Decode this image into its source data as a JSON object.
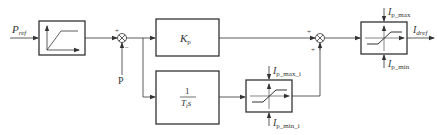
{
  "diagram": {
    "type": "control block diagram",
    "inputs": {
      "p_ref": {
        "main": "P",
        "sub": "ref"
      },
      "p_feedback": "P"
    },
    "blocks": {
      "ramp_limiter": {
        "name": "ramp-rate limiter"
      },
      "kp": {
        "main": "K",
        "sub": "p"
      },
      "integrator": {
        "num": "1",
        "den_main": "T",
        "den_sub": "i",
        "den_tail": "s"
      },
      "limiter_i": {
        "max_main": "I",
        "max_sub": "p_max_i",
        "min_main": "I",
        "min_sub": "p_min_i"
      },
      "limiter_out": {
        "max_main": "I",
        "max_sub": "p_max",
        "min_main": "I",
        "min_sub": "p_min"
      }
    },
    "summers": {
      "sum1": {
        "sign_top_left": "+",
        "sign_bottom": "−"
      },
      "sum2": {
        "sign_left": "+",
        "sign_bottom": "+"
      }
    },
    "output": {
      "main": "I",
      "sub": "dref"
    },
    "colors": {
      "line": "#333333",
      "background": "#ffffff"
    }
  }
}
